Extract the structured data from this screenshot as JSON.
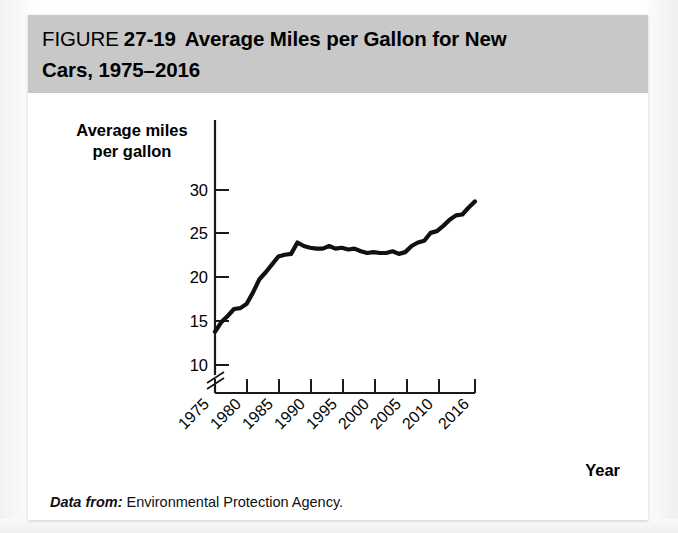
{
  "figure": {
    "label": "FIGURE",
    "number": "27-19",
    "title_line1": "Average Miles per Gallon for New",
    "title_line2": "Cars, 1975–2016",
    "source_lead": "Data from:",
    "source_body": "Environmental Protection Agency."
  },
  "axes": {
    "y_label_line1": "Average miles",
    "y_label_line2": "per gallon",
    "x_label": "Year",
    "y_ticks": [
      "10",
      "15",
      "20",
      "25",
      "30"
    ],
    "x_ticks": [
      "1975",
      "1980",
      "1985",
      "1990",
      "1995",
      "2000",
      "2005",
      "2010",
      "2016"
    ],
    "y_axis_break": true
  },
  "colors": {
    "header_band": "#c8c8c8",
    "panel": "#ffffff",
    "line": "#111111",
    "axis": "#1a1a1a",
    "text": "#000000"
  },
  "chart_data": {
    "type": "line",
    "xlabel": "Year",
    "ylabel": "Average miles per gallon",
    "xlim": [
      1975,
      2016
    ],
    "ylim": [
      9,
      31
    ],
    "y_tick_values": [
      10,
      15,
      20,
      25,
      30
    ],
    "x_tick_values": [
      1975,
      1980,
      1985,
      1990,
      1995,
      2000,
      2005,
      2010,
      2016
    ],
    "grid": false,
    "legend": "none",
    "axis_break_below": 10,
    "source": "Environmental Protection Agency",
    "series": [
      {
        "name": "Average miles per gallon",
        "x": [
          1975,
          1976,
          1977,
          1978,
          1979,
          1980,
          1981,
          1982,
          1983,
          1984,
          1985,
          1986,
          1987,
          1988,
          1989,
          1990,
          1991,
          1992,
          1993,
          1994,
          1995,
          1996,
          1997,
          1998,
          1999,
          2000,
          2001,
          2002,
          2003,
          2004,
          2005,
          2006,
          2007,
          2008,
          2009,
          2010,
          2011,
          2012,
          2013,
          2014,
          2015,
          2016
        ],
        "values": [
          13.8,
          14.9,
          15.6,
          16.4,
          16.5,
          17.0,
          18.3,
          19.8,
          20.6,
          21.5,
          22.4,
          22.6,
          22.7,
          24.0,
          23.6,
          23.4,
          23.3,
          23.3,
          23.6,
          23.3,
          23.4,
          23.2,
          23.3,
          23.0,
          22.8,
          22.9,
          22.8,
          22.8,
          23.0,
          22.7,
          22.9,
          23.6,
          24.0,
          24.2,
          25.1,
          25.3,
          25.9,
          26.6,
          27.1,
          27.2,
          28.0,
          28.7
        ]
      }
    ]
  }
}
